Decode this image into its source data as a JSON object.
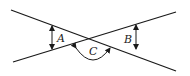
{
  "diagram": {
    "stroke_color": "#1a1a1a",
    "lines": [
      {
        "name": "line-1",
        "x1": 11,
        "y1": 10,
        "x2": 176,
        "y2": 71
      },
      {
        "name": "line-2",
        "x1": 13,
        "y1": 62,
        "x2": 176,
        "y2": 12
      }
    ],
    "labels": {
      "A": "A",
      "B": "B",
      "C": "C"
    }
  }
}
